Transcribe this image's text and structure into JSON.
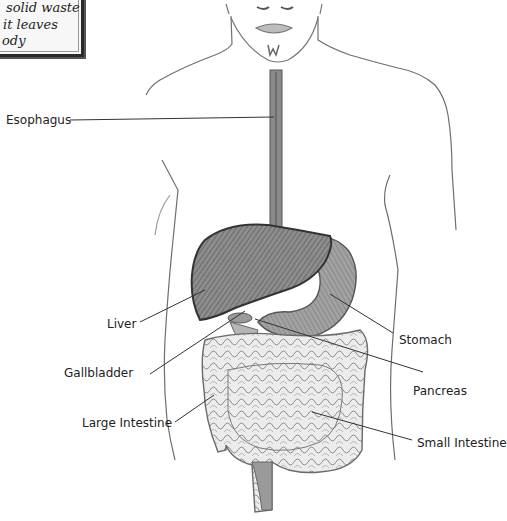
{
  "note_box": {
    "lines": [
      "solid waste",
      "it leaves",
      "ody"
    ]
  },
  "labels": {
    "esophagus": "Esophagus",
    "liver": "Liver",
    "gallbladder": "Gallbladder",
    "large_intestine": "Large Intestine",
    "stomach": "Stomach",
    "pancreas": "Pancreas",
    "small_intestine": "Small Intestine"
  },
  "colors": {
    "ink": "#222222",
    "organ_dark": "#5a5a5a",
    "organ_mid": "#8a8a8a",
    "organ_light": "#c8c8c8",
    "outline": "#6e6e6e"
  }
}
